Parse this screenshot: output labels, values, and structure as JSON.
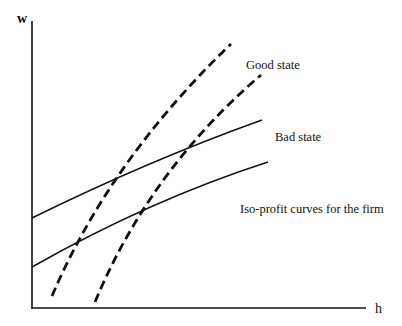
{
  "axes": {
    "y_label": "w",
    "x_label": "h"
  },
  "labels": {
    "good_state": "Good state",
    "bad_state": "Bad state",
    "iso_profit": "Iso-profit curves for the firm"
  },
  "colors": {
    "line": "#111111",
    "background": "#ffffff"
  },
  "curves": {
    "solid_upper": "M32,218 Q150,160 262,120",
    "solid_lower": "M32,267 Q150,200 268,162",
    "dashed_left": "M52,296 Q110,160 231,44",
    "dashed_right": "M95,302 Q150,170 261,75"
  }
}
